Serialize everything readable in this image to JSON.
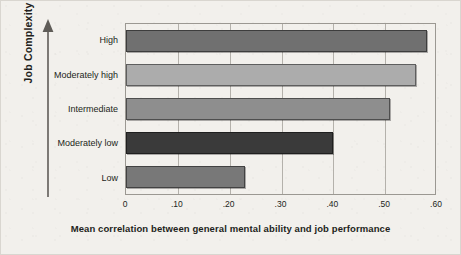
{
  "chart_data": {
    "type": "bar",
    "orientation": "horizontal",
    "title": "",
    "xlabel": "Mean correlation between general mental ability and job performance",
    "ylabel": "Job Complexity",
    "categories": [
      "Low",
      "Moderately low",
      "Intermediate",
      "Moderately high",
      "High"
    ],
    "values": [
      0.23,
      0.4,
      0.51,
      0.56,
      0.58
    ],
    "xlim": [
      0,
      0.6
    ],
    "ylim": null,
    "xticks": [
      0,
      0.1,
      0.2,
      0.3,
      0.4,
      0.5,
      0.6
    ],
    "xtick_labels": [
      "0",
      ".10",
      ".20",
      ".30",
      ".40",
      ".50",
      ".60"
    ],
    "grid": "vertical",
    "legend": "none",
    "bar_colors": [
      "#787878",
      "#3a3a3a",
      "#8e8e8e",
      "#acacac",
      "#707070"
    ],
    "series": [
      {
        "name": "Mean correlation",
        "points": [
          {
            "category": "High",
            "value": 0.58,
            "color": "#707070"
          },
          {
            "category": "Moderately high",
            "value": 0.56,
            "color": "#acacac"
          },
          {
            "category": "Intermediate",
            "value": 0.51,
            "color": "#8e8e8e"
          },
          {
            "category": "Moderately low",
            "value": 0.4,
            "color": "#3a3a3a"
          },
          {
            "category": "Low",
            "value": 0.23,
            "color": "#787878"
          }
        ]
      }
    ]
  },
  "axes": {
    "y_title": "Job Complexity",
    "x_title": "Mean correlation between general mental ability and job performance",
    "category_labels": {
      "r0": "High",
      "r1": "Moderately high",
      "r2": "Intermediate",
      "r3": "Moderately low",
      "r4": "Low"
    },
    "x_tick_labels": {
      "t0": "0",
      "t1": ".10",
      "t2": ".20",
      "t3": ".30",
      "t4": ".40",
      "t5": ".50",
      "t6": ".60"
    }
  },
  "style": {
    "page_background": "#f2f0ec",
    "page_border": "#d9d6d0",
    "plot_border": "#9b9892",
    "gridline_color": "#b4b1ab",
    "text_color": "#231f20",
    "axis_arrow_color": "#5f5c58"
  }
}
